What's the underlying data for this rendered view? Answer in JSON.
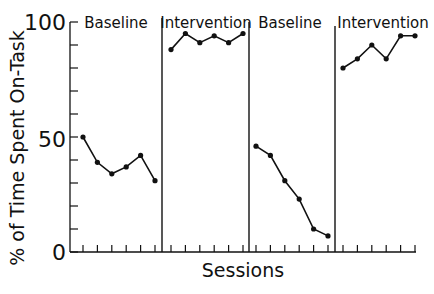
{
  "chart_data": {
    "type": "line",
    "title": "",
    "xlabel": "Sessions",
    "ylabel": "% of Time Spent On-Task",
    "ylim": [
      0,
      100
    ],
    "yticks": [
      0,
      50,
      100
    ],
    "ytick_labels": [
      "0",
      "50",
      "100"
    ],
    "grid": false,
    "legend": null,
    "phases": [
      {
        "label": "Baseline",
        "sessions": [
          1,
          2,
          3,
          4,
          5,
          6
        ],
        "values": [
          50,
          39,
          34,
          37,
          42,
          31
        ]
      },
      {
        "label": "Intervention",
        "sessions": [
          7,
          8,
          9,
          10,
          11,
          12
        ],
        "values": [
          88,
          95,
          91,
          94,
          91,
          95
        ]
      },
      {
        "label": "Baseline",
        "sessions": [
          13,
          14,
          15,
          16,
          17,
          18
        ],
        "values": [
          46,
          42,
          31,
          23,
          10,
          7
        ]
      },
      {
        "label": "Intervention",
        "sessions": [
          19,
          20,
          21,
          22,
          23,
          24
        ],
        "values": [
          80,
          84,
          90,
          84,
          94,
          94
        ]
      }
    ]
  },
  "labels": {
    "phase1": "Baseline",
    "phase2": "Intervention",
    "phase3": "Baseline",
    "phase4": "Intervention",
    "y100": "100",
    "y50": "50",
    "y0": "0",
    "xlabel": "Sessions",
    "ylabel": "% of Time Spent On-Task"
  }
}
